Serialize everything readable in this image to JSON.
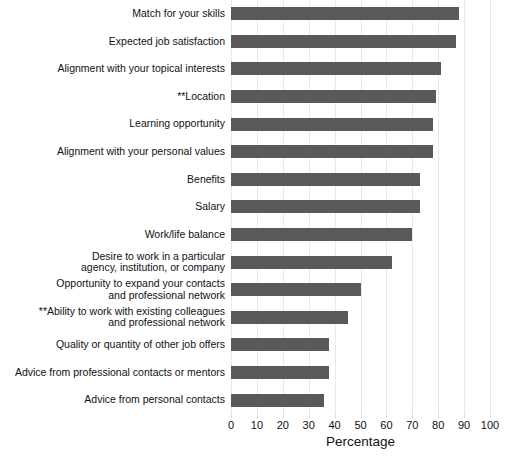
{
  "chart_data": {
    "type": "bar",
    "orientation": "horizontal",
    "title": "",
    "xlabel": "Percentage",
    "ylabel": "",
    "xlim": [
      0,
      100
    ],
    "xticks": [
      0,
      10,
      20,
      30,
      40,
      50,
      60,
      70,
      80,
      90,
      100
    ],
    "grid": true,
    "legend": "none",
    "bar_color": "#595959",
    "categories": [
      "Match for your skills",
      "Expected job satisfaction",
      "Alignment with your topical interests",
      "**Location",
      "Learning opportunity",
      "Alignment with your personal values",
      "Benefits",
      "Salary",
      "Work/life balance",
      "Desire to work in a particular agency, institution, or company",
      "Opportunity to expand your contacts and professional network",
      "**Ability to work with existing colleagues and professional network",
      "Quality or quantity of other job offers",
      "Advice from professional contacts or mentors",
      "Advice from personal contacts"
    ],
    "category_lines": [
      [
        "Match for your skills"
      ],
      [
        "Expected job satisfaction"
      ],
      [
        "Alignment with your topical interests"
      ],
      [
        "**Location"
      ],
      [
        "Learning opportunity"
      ],
      [
        "Alignment with your personal values"
      ],
      [
        "Benefits"
      ],
      [
        "Salary"
      ],
      [
        "Work/life balance"
      ],
      [
        "Desire to work in a particular",
        "agency, institution, or company"
      ],
      [
        "Opportunity to expand your contacts",
        "and professional network"
      ],
      [
        "**Ability to work with existing colleagues",
        "and professional network"
      ],
      [
        "Quality or quantity of other job offers"
      ],
      [
        "Advice from professional contacts or mentors"
      ],
      [
        "Advice from personal contacts"
      ]
    ],
    "values": [
      88,
      87,
      81,
      79,
      78,
      78,
      73,
      73,
      70,
      62,
      50,
      45,
      38,
      38,
      36
    ]
  }
}
